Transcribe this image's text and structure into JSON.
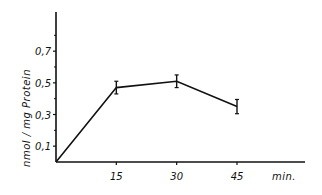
{
  "chart_data": {
    "type": "line",
    "title": "",
    "xlabel": "min.",
    "ylabel": "nmol / mg  Protein",
    "x": [
      15,
      30,
      45
    ],
    "x_tick_labels": [
      "15",
      "30",
      "45"
    ],
    "y_tick_labels": [
      "0,1",
      "0,3",
      "0,5",
      "0,7"
    ],
    "y_ticks": [
      0.1,
      0.3,
      0.5,
      0.7
    ],
    "xlim": [
      0,
      60
    ],
    "ylim": [
      0,
      0.85
    ],
    "grid": false,
    "legend": null,
    "series": [
      {
        "name": "nmol/mg Protein",
        "x": [
          0,
          15,
          30,
          45
        ],
        "values": [
          0,
          0.47,
          0.51,
          0.35
        ],
        "error": [
          0,
          0.04,
          0.04,
          0.045
        ]
      }
    ]
  }
}
